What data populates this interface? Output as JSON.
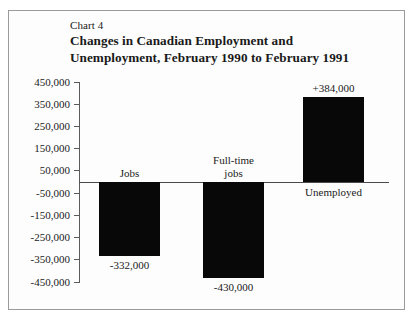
{
  "figure": {
    "chart_number": "Chart 4",
    "title_line1": "Changes in Canadian Employment and",
    "title_line2": "Unemployment, February 1990 to February 1991"
  },
  "chart_data": {
    "type": "bar",
    "title": "Changes in Canadian Employment and Unemployment, February 1990 to February 1991",
    "subtitle": "Chart 4",
    "xlabel": "",
    "ylabel": "",
    "categories": [
      "Jobs",
      "Full-time jobs",
      "Unemployed"
    ],
    "values": [
      -332000,
      -430000,
      384000
    ],
    "value_labels": [
      "-332,000",
      "-430,000",
      "+384,000"
    ],
    "category_labels": [
      [
        "Jobs"
      ],
      [
        "Full-time",
        "jobs"
      ],
      [
        "Unemployed"
      ]
    ],
    "ylim": [
      -450000,
      450000
    ],
    "ytick_values": [
      450000,
      350000,
      250000,
      150000,
      50000,
      -50000,
      -150000,
      -250000,
      -350000,
      -450000
    ],
    "ytick_labels": [
      "450,000",
      "350,000",
      "250,000",
      "150,000",
      "50,000",
      "-50,000",
      "-150,000",
      "-250,000",
      "-350,000",
      "-450,000"
    ],
    "grid": false,
    "legend": null,
    "bar_color": "#080808",
    "axis_color": "#5b5b5b",
    "background": "#ffffff"
  }
}
